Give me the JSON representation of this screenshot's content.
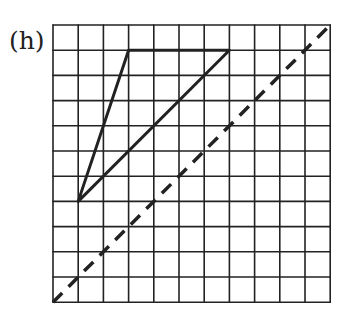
{
  "figure": {
    "label": "(h)",
    "grid": {
      "columns": 11,
      "rows": 11,
      "cell_size": 25.2,
      "origin_x": 53,
      "origin_y": 25
    },
    "triangle": {
      "vertices_grid": [
        [
          3,
          1
        ],
        [
          7,
          1
        ],
        [
          1,
          7
        ]
      ],
      "description": "Solid triangle with vertices at grid points (col,row from top-left)"
    },
    "mirror_line": {
      "style": "dashed",
      "from_grid": [
        0,
        11
      ],
      "to_grid": [
        11,
        0
      ],
      "description": "Dashed diagonal line of reflection from bottom-left to top-right"
    },
    "colors": {
      "lines": "#222222",
      "background": "#ffffff"
    }
  }
}
